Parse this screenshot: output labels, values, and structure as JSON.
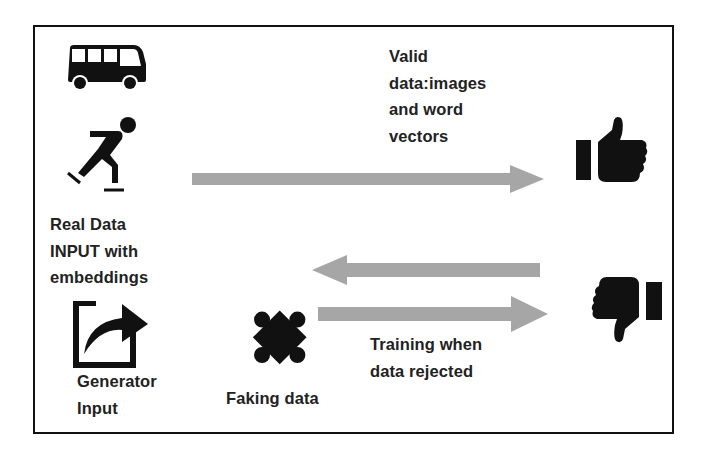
{
  "diagram": {
    "nodes": {
      "real_data": {
        "icons": [
          "bus-icon",
          "ice-skater-icon"
        ],
        "label": "Real Data\nINPUT with\nembeddings"
      },
      "generator": {
        "icon": "share-arrow-icon",
        "label": "Generator\nInput"
      },
      "faking": {
        "icon": "puzzle-piece-icon",
        "label": "Faking data"
      },
      "accept": {
        "icon": "thumbs-up-icon"
      },
      "reject": {
        "icon": "thumbs-down-icon"
      }
    },
    "edges": [
      {
        "from": "real_data",
        "to": "accept",
        "label": "Valid\ndata:images\nand word\nvectors"
      },
      {
        "from": "reject",
        "to": "faking",
        "label": ""
      },
      {
        "from": "faking",
        "to": "reject",
        "label": "Training when\ndata rejected"
      }
    ],
    "colors": {
      "arrow": "#a6a6a6",
      "icon": "#111111",
      "border": "#111111",
      "text": "#222222"
    }
  }
}
